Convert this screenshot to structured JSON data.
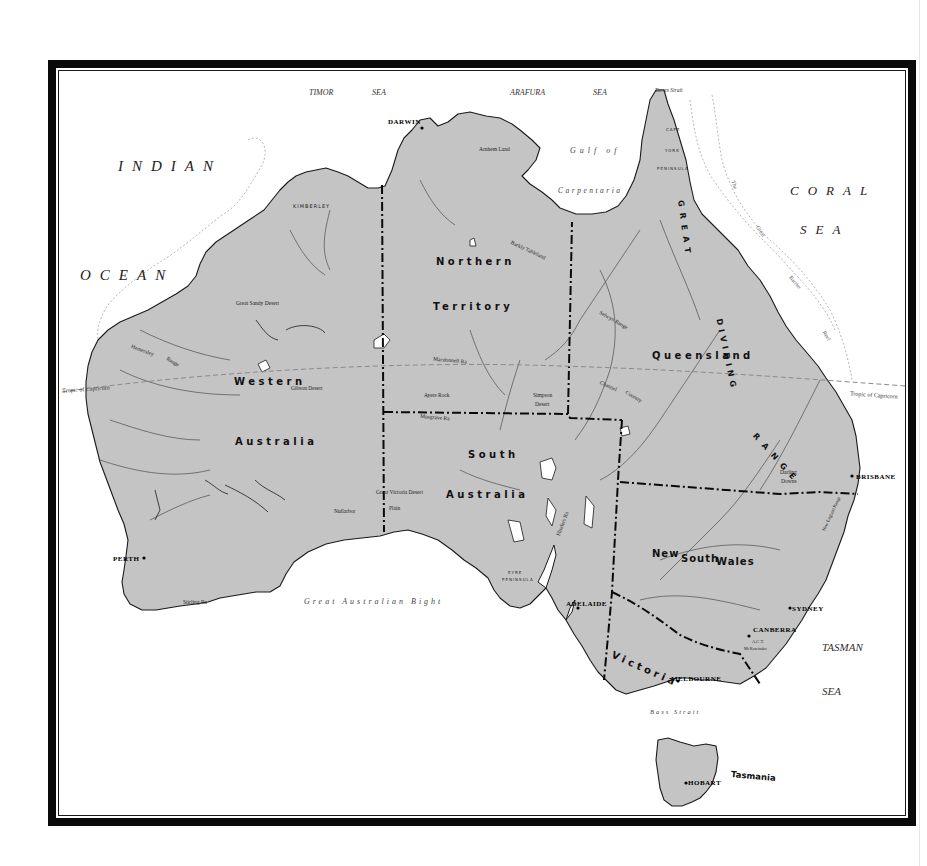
{
  "map": {
    "title": "Australia",
    "colors": {
      "land": "#c4c4c4",
      "sea": "#ffffff",
      "coastline": "#1a1a1a",
      "river": "#5a5a5a",
      "border": "#0a0a0a",
      "frame": "#0a0a0a",
      "reef": "#b0b0b0"
    },
    "seas": {
      "indian": "INDIAN",
      "ocean": "OCEAN",
      "timor": "TIMOR",
      "timor_sea": "SEA",
      "arafura": "ARAFURA",
      "arafura_sea": "SEA",
      "coral": "CORAL",
      "coral_sea": "SEA",
      "tasman": "TASMAN",
      "tasman_sea": "SEA",
      "gulf_of": "Gulf of",
      "carpentaria": "Carpentaria",
      "great_australian_bight": "Great Australian Bight",
      "bass_strait": "Bass Strait",
      "torres_strait": "Torres Strait"
    },
    "states": {
      "western": "Western",
      "australia_wa": "Australia",
      "northern": "Northern",
      "territory": "Territory",
      "queensland": "Queensland",
      "south": "South",
      "australia_sa": "Australia",
      "new_south_wales_1": "New",
      "new_south_wales_2": "South",
      "new_south_wales_3": "Wales",
      "victoria": "Victoria",
      "tasmania": "Tasmania"
    },
    "cities": {
      "darwin": "DARWIN",
      "perth": "PERTH",
      "adelaide": "ADELAIDE",
      "melbourne": "MELBOURNE",
      "canberra": "CANBERRA",
      "sydney": "SYDNEY",
      "brisbane": "BRISBANE",
      "hobart": "HOBART",
      "act": "A.C.T."
    },
    "regions": {
      "kimberley": "KIMBERLEY",
      "arnhem_land": "Arnhem   Land",
      "cape": "CAPE",
      "york": "YORK",
      "peninsula": "PENINSULA",
      "barkly_tableland": "Barkly Tableland",
      "great_sandy_desert": "Great    Sandy    Desert",
      "gibson_desert": "Gibson Desert",
      "hamersley": "Hamersley",
      "range": "Range",
      "macdonnell_ra": "Macdonnell Ra",
      "ayers_rock": "Ayers Rock",
      "musgrave_ra": "Musgrave Ra",
      "simpson": "Simpson",
      "desert": "Desert",
      "selwyn_range": "Selwyn Range",
      "channel": "Channel",
      "country": "Country",
      "great_victoria_desert": "Great Victoria Desert",
      "nullarbor": "Nullarbor",
      "plain": "Plain",
      "flinders_ra": "Flinders Ra",
      "eyre": "EYRE",
      "eyre_peninsula": "PENINSULA",
      "stirling_ra": "Stirling Ra",
      "darling": "Darling",
      "downs": "Downs",
      "new_england_range": "New England Range",
      "the": "The",
      "great_reef": "Great",
      "barrier": "Barrier",
      "reef": "Reef",
      "kosciusko": "Mt Kosciusko"
    },
    "ranges": {
      "great": "GREAT",
      "dividing": "DIVIDING",
      "range": "RANGE"
    },
    "tropic": {
      "west": "Tropic of Capricorn",
      "east": "Tropic of Capricorn"
    }
  }
}
